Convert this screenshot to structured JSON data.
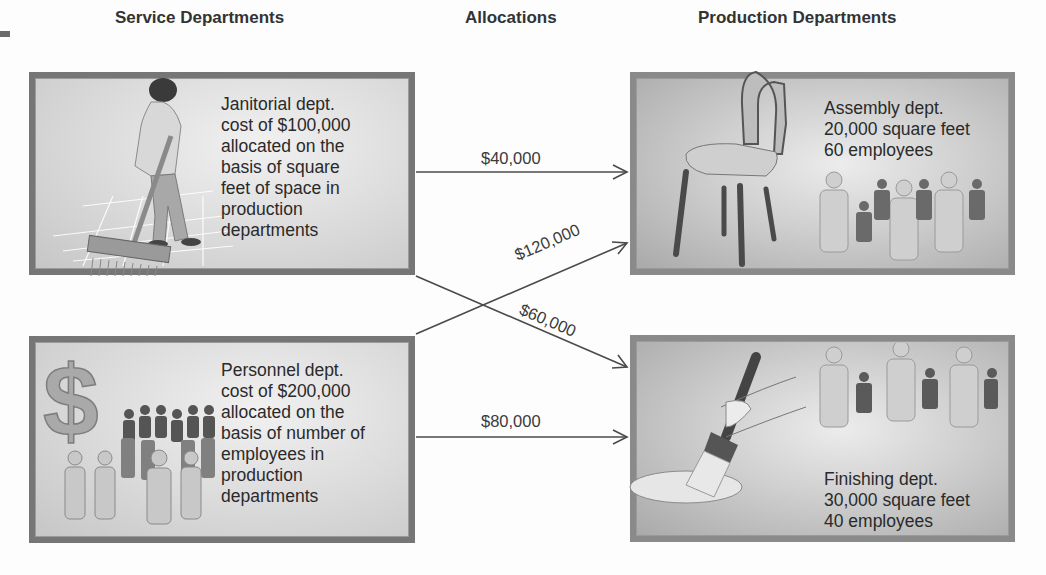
{
  "headers": {
    "service": "Service Departments",
    "allocations": "Allocations",
    "production": "Production Departments"
  },
  "service_departments": [
    {
      "name": "Janitorial dept.",
      "lines": [
        "Janitorial dept.",
        "cost of $100,000",
        "allocated on the",
        "basis of square",
        "feet of space in",
        "production",
        "departments"
      ],
      "illustration": "janitor-sweeping-icon"
    },
    {
      "name": "Personnel dept.",
      "lines": [
        "Personnel dept.",
        "cost of $200,000",
        "allocated on the",
        "basis of number of",
        "employees in",
        "production",
        "departments"
      ],
      "illustration": "dollar-sign-crowd-icon"
    }
  ],
  "production_departments": [
    {
      "name": "Assembly dept.",
      "lines": [
        "Assembly dept.",
        "20,000 square feet",
        "60 employees"
      ],
      "illustration": "chair-workers-icon"
    },
    {
      "name": "Finishing dept.",
      "lines": [
        "Finishing dept.",
        "30,000 square feet",
        "40 employees"
      ],
      "illustration": "paintbrush-workers-icon"
    }
  ],
  "allocations": [
    {
      "from": "Janitorial dept.",
      "to": "Assembly dept.",
      "amount": "$40,000"
    },
    {
      "from": "Personnel dept.",
      "to": "Assembly dept.",
      "amount": "$120,000"
    },
    {
      "from": "Janitorial dept.",
      "to": "Finishing dept.",
      "amount": "$60,000"
    },
    {
      "from": "Personnel dept.",
      "to": "Finishing dept.",
      "amount": "$80,000"
    }
  ],
  "colors": {
    "box_border": "#767676",
    "arrow": "#4a4a4a",
    "text": "#2a2a2a"
  }
}
